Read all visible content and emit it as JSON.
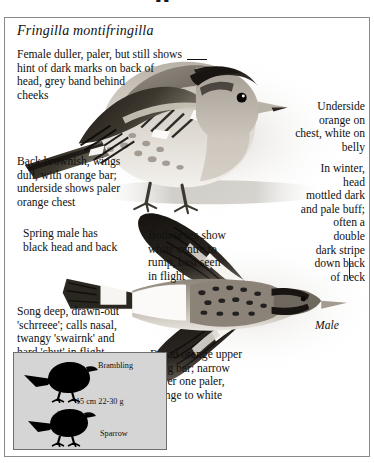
{
  "page": {
    "clipped_heading_fragment": "g",
    "scientific_name": "Fringilla montifringilla"
  },
  "captions": {
    "female": "Female duller, paler, but still shows\nhint of dark marks on back of\nhead, grey band behind\ncheeks",
    "underside": "Underside\norange on\nchest, white on\nbelly",
    "back": "Back brownish, wings\ndull, with orange bar;\nunderside shows paler\norange chest",
    "winter": "In winter,\nhead\nmottled dark\nand pale buff;\noften a\ndouble\ndark stripe\ndown back\nof neck",
    "spring_male": "Spring male has\nblack head and back",
    "both_sexes": "Both sexes show\nwhite centre to\nrump, best seen\nin flight",
    "song": "Song deep, drawn-out\n'schrreee'; calls nasal,\ntwangy 'swairnk' and\nhard 'chut' in flight",
    "broad_bar": "Broad orange upper\nwing bar; narrow\nlower one paler,\norange to white"
  },
  "labels": {
    "male": "Male"
  },
  "size_comparison": {
    "species_label": "Brambling",
    "reference_label": "Sparrow",
    "measurements": "15 cm  22-30 g"
  },
  "colors": {
    "page_background": "#ffffff",
    "plate_border": "#8a8a8a",
    "text": "#111111",
    "compare_box_background": "#d5d5d5",
    "compare_box_border": "#6e6e6e",
    "silhouette": "#000000"
  },
  "illustrations": {
    "perched_bird": "brambling-perched-side-view",
    "flying_bird": "brambling-male-flying-from-above"
  }
}
